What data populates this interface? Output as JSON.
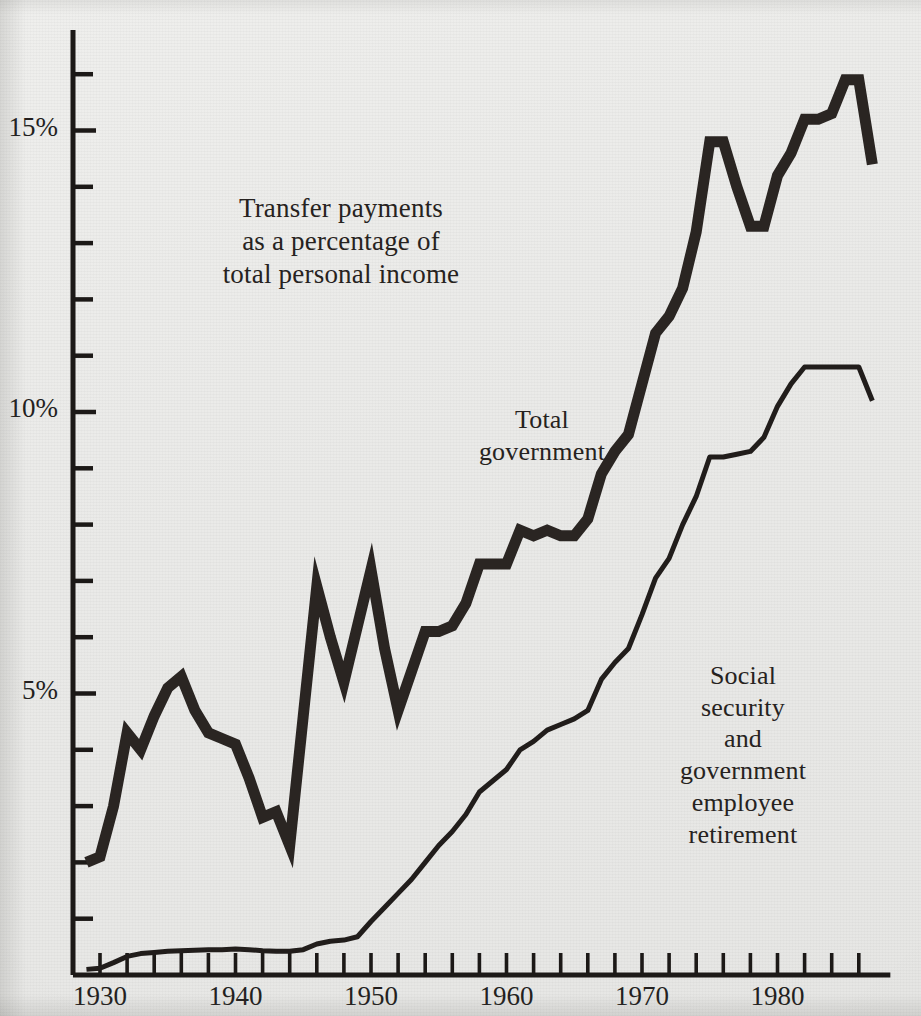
{
  "chart_data": {
    "type": "line",
    "title": "",
    "annotation_main": "Transfer payments\nas a percentage of\ntotal personal income",
    "xlabel": "",
    "ylabel": "",
    "x": [
      1929,
      1930,
      1931,
      1932,
      1933,
      1934,
      1935,
      1936,
      1937,
      1938,
      1939,
      1940,
      1941,
      1942,
      1943,
      1944,
      1945,
      1946,
      1947,
      1948,
      1949,
      1950,
      1951,
      1952,
      1953,
      1954,
      1955,
      1956,
      1957,
      1958,
      1959,
      1960,
      1961,
      1962,
      1963,
      1964,
      1965,
      1966,
      1967,
      1968,
      1969,
      1970,
      1971,
      1972,
      1973,
      1974,
      1975,
      1976,
      1977,
      1978,
      1979,
      1980,
      1981,
      1982,
      1983,
      1984,
      1985,
      1986,
      1987
    ],
    "xlim": [
      1929,
      1987
    ],
    "ylim": [
      0,
      16.5
    ],
    "xticks": [
      1930,
      1932,
      1934,
      1936,
      1938,
      1940,
      1942,
      1944,
      1946,
      1948,
      1950,
      1952,
      1954,
      1956,
      1958,
      1960,
      1962,
      1964,
      1966,
      1968,
      1970,
      1972,
      1974,
      1976,
      1978,
      1980,
      1982,
      1984,
      1986
    ],
    "xtick_labels": [
      "1930",
      "1940",
      "1950",
      "1960",
      "1970",
      "1980"
    ],
    "xtick_label_values": [
      1930,
      1940,
      1950,
      1960,
      1970,
      1980
    ],
    "yticks": [
      1,
      2,
      3,
      4,
      5,
      6,
      7,
      8,
      9,
      10,
      11,
      12,
      13,
      14,
      15,
      16
    ],
    "ytick_labels": [
      "5%",
      "10%",
      "15%"
    ],
    "ytick_label_values": [
      5,
      10,
      15
    ],
    "grid": false,
    "legend_position": "inline-annotation",
    "series": [
      {
        "name": "Total government",
        "label": "Total\ngovernment",
        "style": "thick",
        "color": "#2a2522",
        "width": 11,
        "values": [
          2.0,
          2.1,
          3.0,
          4.3,
          4.0,
          4.6,
          5.1,
          5.3,
          4.7,
          4.3,
          4.2,
          4.1,
          3.5,
          2.8,
          2.9,
          2.3,
          4.6,
          6.9,
          6.0,
          5.2,
          6.2,
          7.2,
          5.8,
          4.7,
          5.4,
          6.1,
          6.1,
          6.2,
          6.6,
          7.3,
          7.3,
          7.3,
          7.9,
          7.8,
          7.9,
          7.8,
          7.8,
          8.1,
          8.9,
          9.3,
          9.6,
          10.5,
          11.4,
          11.7,
          12.2,
          13.2,
          14.8,
          14.8,
          14.0,
          13.3,
          13.3,
          14.2,
          14.6,
          15.2,
          15.2,
          15.3,
          15.9,
          15.9,
          14.4
        ]
      },
      {
        "name": "Social security and government employee retirement",
        "label": "Social\nsecurity\nand\ngovernment\nemployee\nretirement",
        "style": "thin",
        "color": "#211d1b",
        "width": 5,
        "values": [
          0.1,
          0.12,
          0.22,
          0.33,
          0.38,
          0.4,
          0.42,
          0.43,
          0.44,
          0.45,
          0.45,
          0.46,
          0.45,
          0.43,
          0.42,
          0.42,
          0.45,
          0.55,
          0.6,
          0.62,
          0.68,
          0.95,
          1.2,
          1.45,
          1.7,
          2.0,
          2.3,
          2.55,
          2.85,
          3.25,
          3.45,
          3.65,
          4.0,
          4.15,
          4.35,
          4.45,
          4.55,
          4.7,
          5.25,
          5.55,
          5.8,
          6.4,
          7.05,
          7.4,
          8.0,
          8.5,
          9.2,
          9.2,
          9.25,
          9.3,
          9.55,
          10.1,
          10.5,
          10.8,
          10.8,
          10.8,
          10.8,
          10.8,
          10.2
        ]
      }
    ]
  },
  "axes": {
    "y_tick_labels": [
      {
        "text": "15%",
        "value": 15
      },
      {
        "text": "10%",
        "value": 10
      },
      {
        "text": "5%",
        "value": 5
      }
    ],
    "x_tick_labels": [
      {
        "text": "1930",
        "value": 1930
      },
      {
        "text": "1940",
        "value": 1940
      },
      {
        "text": "1950",
        "value": 1950
      },
      {
        "text": "1960",
        "value": 1960
      },
      {
        "text": "1970",
        "value": 1970
      },
      {
        "text": "1980",
        "value": 1980
      }
    ]
  },
  "annotations": {
    "main": "Transfer payments\nas a percentage of\ntotal personal income",
    "total_government": "Total\ngovernment",
    "social_security": "Social\nsecurity\nand\ngovernment\nemployee\nretirement"
  },
  "colors": {
    "background": "#eaeae8",
    "ink": "#231f1e",
    "line_thick": "#2a2522",
    "line_thin": "#211d1b",
    "axis": "#1c1917"
  }
}
